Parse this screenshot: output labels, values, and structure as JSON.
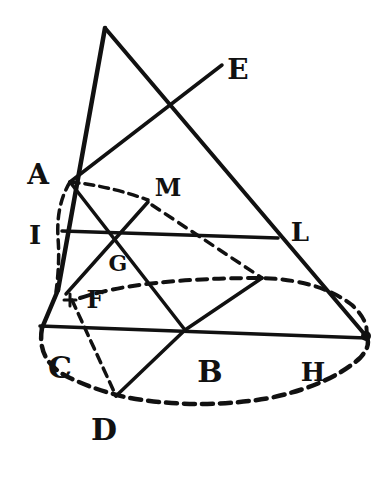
{
  "diagram": {
    "type": "geometric-figure",
    "stroke_color": "#111111",
    "background": "#ffffff",
    "labels": {
      "A": "A",
      "E": "E",
      "M": "M",
      "I": "I",
      "L": "L",
      "G": "G",
      "F": "F",
      "C": "C",
      "B": "B",
      "H": "H",
      "D": "D"
    },
    "label_positions": {
      "A": [
        38,
        175
      ],
      "E": [
        238,
        68
      ],
      "M": [
        167,
        186
      ],
      "I": [
        35,
        233
      ],
      "L": [
        299,
        232
      ],
      "G": [
        118,
        261
      ],
      "F": [
        97,
        295
      ],
      "C": [
        57,
        368
      ],
      "B": [
        211,
        372
      ],
      "H": [
        313,
        371
      ],
      "D": [
        103,
        428
      ]
    },
    "points": {
      "apex": [
        105,
        28
      ],
      "E": [
        222,
        65
      ],
      "A": [
        70,
        182
      ],
      "M": [
        148,
        202
      ],
      "I_left": [
        60,
        240
      ],
      "L": [
        278,
        238
      ],
      "G": [
        118,
        234
      ],
      "F": [
        70,
        297
      ],
      "C": [
        40,
        327
      ],
      "B": [
        185,
        330
      ],
      "H": [
        366,
        336
      ],
      "D": [
        116,
        396
      ],
      "K": [
        262,
        278
      ]
    }
  }
}
